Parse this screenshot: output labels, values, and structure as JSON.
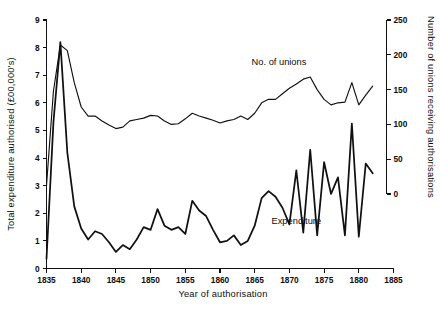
{
  "chart_data": {
    "type": "line",
    "title": "",
    "xlabel": "Year of authorisation",
    "ylabel": "Total expenditure authorised (£00,000's)",
    "y2label": "Number of unions receiving authorisations",
    "grid": false,
    "legend_position": "inline-annotations",
    "xlim": [
      1835,
      1885
    ],
    "ylim": [
      0,
      9
    ],
    "y2lim": [
      0,
      250
    ],
    "xticks": [
      1835,
      1840,
      1845,
      1850,
      1855,
      1860,
      1865,
      1870,
      1875,
      1880,
      1885
    ],
    "xtick_labels": [
      "1835",
      "1840",
      "1845",
      "1850",
      "1855",
      "1860",
      "1865",
      "1870",
      "1875",
      "1880",
      "1885"
    ],
    "yticks": [
      0,
      1,
      2,
      3,
      4,
      5,
      6,
      7,
      8,
      9
    ],
    "ytick_labels": [
      "0",
      "1",
      "2",
      "3",
      "4",
      "5",
      "6",
      "7",
      "8",
      "9"
    ],
    "y2ticks": [
      0,
      50,
      100,
      150,
      200,
      250
    ],
    "y2tick_labels": [
      "0",
      "50",
      "100",
      "150",
      "200",
      "250"
    ],
    "annotations": [
      {
        "text": "No. of unions",
        "x": 1868.5,
        "y_axis": "right",
        "y": 185
      },
      {
        "text": "Expenditure",
        "x": 1871.0,
        "y_axis": "left",
        "y": 1.62
      }
    ],
    "series": [
      {
        "name": "Expenditure",
        "axis": "left",
        "units": "£00,000's",
        "x": [
          1835,
          1836,
          1837,
          1838,
          1839,
          1840,
          1841,
          1842,
          1843,
          1844,
          1845,
          1846,
          1847,
          1848,
          1849,
          1850,
          1851,
          1852,
          1853,
          1854,
          1855,
          1856,
          1857,
          1858,
          1859,
          1860,
          1861,
          1862,
          1863,
          1864,
          1865,
          1866,
          1867,
          1868,
          1869,
          1870,
          1871,
          1872,
          1873,
          1874,
          1875,
          1876,
          1877,
          1878,
          1879,
          1880,
          1881,
          1882
        ],
        "values": [
          0.35,
          5.3,
          8.2,
          4.2,
          2.25,
          1.45,
          1.05,
          1.35,
          1.25,
          0.95,
          0.6,
          0.85,
          0.7,
          1.05,
          1.5,
          1.4,
          2.15,
          1.55,
          1.4,
          1.5,
          1.25,
          2.45,
          2.1,
          1.9,
          1.4,
          0.95,
          1.0,
          1.2,
          0.85,
          1.0,
          1.55,
          2.55,
          2.8,
          2.6,
          2.2,
          1.6,
          3.55,
          1.3,
          4.3,
          1.2,
          3.85,
          2.7,
          3.3,
          1.2,
          5.25,
          1.15,
          3.8,
          3.45
        ]
      },
      {
        "name": "No. of unions",
        "axis": "right",
        "units": "unions",
        "x": [
          1835,
          1836,
          1837,
          1838,
          1839,
          1840,
          1841,
          1842,
          1843,
          1844,
          1845,
          1846,
          1847,
          1848,
          1849,
          1850,
          1851,
          1852,
          1853,
          1854,
          1855,
          1856,
          1857,
          1858,
          1859,
          1860,
          1861,
          1862,
          1863,
          1864,
          1865,
          1866,
          1867,
          1868,
          1869,
          1870,
          1871,
          1872,
          1873,
          1874,
          1875,
          1876,
          1877,
          1878,
          1879,
          1880,
          1881,
          1882
        ],
        "values": [
          12,
          148,
          214,
          206,
          160,
          125,
          112,
          112,
          105,
          99,
          94,
          96,
          105,
          107,
          109,
          113,
          112,
          105,
          100,
          101,
          108,
          116,
          112,
          109,
          106,
          102,
          105,
          107,
          112,
          107,
          116,
          131,
          136,
          136,
          144,
          152,
          158,
          165,
          168,
          150,
          136,
          128,
          131,
          132,
          160,
          128,
          142,
          155
        ]
      }
    ]
  }
}
